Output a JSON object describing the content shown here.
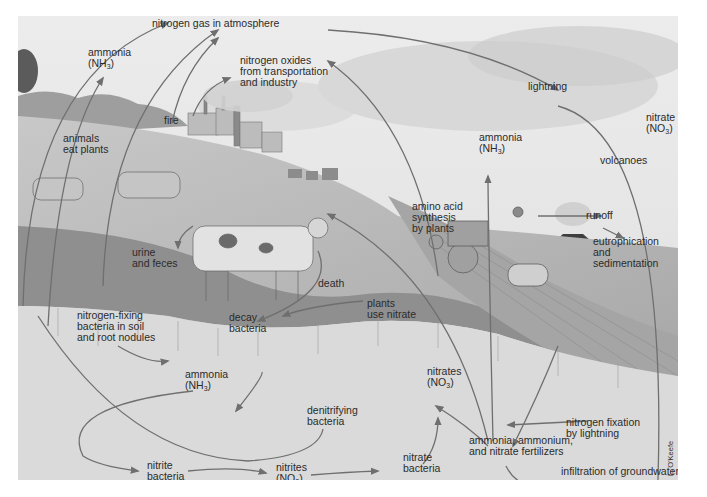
{
  "diagram": {
    "credit": "L. O'Keefe",
    "colors": {
      "sky": "#e6e6e6",
      "clouds": "#cfcfcf",
      "hill": "#bdbdbd",
      "grass": "#8d8d8d",
      "soil": "#dcdcdc",
      "arrow": "#6f6f6f",
      "text": "#2b2b2b"
    },
    "labels": {
      "nitrogen_gas": "nitrogen gas in atmosphere",
      "ammonia_top": {
        "line1": "ammonia",
        "formula": "NH",
        "sub": "3"
      },
      "nitrogen_oxides": {
        "line1": "nitrogen oxides",
        "line2": "from transportation",
        "line3": "and industry"
      },
      "fire": "fire",
      "lightning": "lightning",
      "nitrate_top": {
        "line1": "nitrate",
        "formula": "NO",
        "sub": "3"
      },
      "animals_eat_plants": {
        "line1": "animals",
        "line2": "eat plants"
      },
      "ammonia_mid": {
        "line1": "ammonia",
        "formula": "NH",
        "sub": "3"
      },
      "volcanoes": "volcanoes",
      "amino_acid": {
        "line1": "amino acid",
        "line2": "synthesis",
        "line3": "by plants"
      },
      "runoff": "runoff",
      "eutrophication": {
        "line1": "eutrophication",
        "line2": "and",
        "line3": "sedimentation"
      },
      "urine_feces": {
        "line1": "urine",
        "line2": "and feces"
      },
      "death": "death",
      "plants_use_nitrate": {
        "line1": "plants",
        "line2": "use nitrate"
      },
      "nitrogen_fixing": {
        "line1": "nitrogen-fixing",
        "line2": "bacteria in soil",
        "line3": "and root nodules"
      },
      "decay_bacteria": {
        "line1": "decay",
        "line2": "bacteria"
      },
      "ammonia_soil": {
        "line1": "ammonia",
        "formula": "NH",
        "sub": "3"
      },
      "nitrates_soil": {
        "line1": "nitrates",
        "formula": "NO",
        "sub": "3"
      },
      "denitrifying": {
        "line1": "denitrifying",
        "line2": "bacteria"
      },
      "nitrogen_fixation_lightning": {
        "line1": "nitrogen fixation",
        "line2": "by lightning"
      },
      "fertilizers": {
        "line1": "ammonia, ammonium,",
        "line2": "and nitrate fertilizers"
      },
      "nitrite_bacteria": {
        "line1": "nitrite",
        "line2": "bacteria"
      },
      "nitrites": {
        "line1": "nitrites",
        "formula": "NO",
        "sub": "2"
      },
      "nitrate_bacteria": {
        "line1": "nitrate",
        "line2": "bacteria"
      },
      "infiltration": "infiltration of groundwater"
    }
  }
}
